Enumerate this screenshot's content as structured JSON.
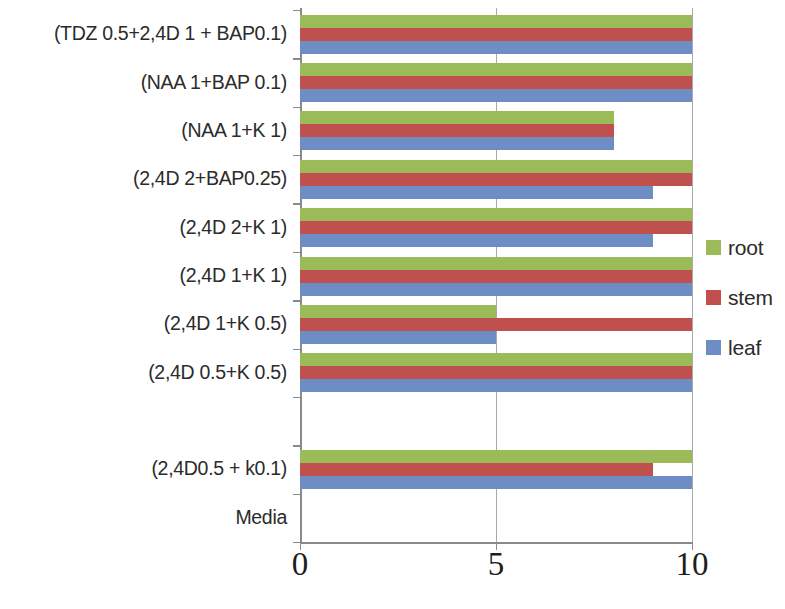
{
  "chart_data": {
    "type": "bar",
    "orientation": "horizontal",
    "title": "",
    "xlabel": "",
    "ylabel": "",
    "xlim": [
      0,
      10
    ],
    "xticks": [
      "0",
      "5",
      "10"
    ],
    "xtick_values": [
      0,
      5,
      10
    ],
    "grid": "vertical",
    "legend_position": "right",
    "categories": [
      "(TDZ 0.5+2,4D 1  + BAP0.1)",
      "(NAA 1+BAP 0.1)",
      "(NAA 1+K 1)",
      "(2,4D 2+BAP0.25)",
      "(2,4D 2+K 1)",
      "(2,4D 1+K 1)",
      "(2,4D 1+K 0.5)",
      "(2,4D 0.5+K 0.5)",
      "",
      "(2,4D0.5 + k0.1)",
      "Media"
    ],
    "series": [
      {
        "name": "root",
        "color": "#9bbb59",
        "values": [
          10,
          10,
          8,
          10,
          10,
          10,
          5,
          10,
          0,
          10,
          0
        ]
      },
      {
        "name": "stem",
        "color": "#c0504d",
        "values": [
          10,
          10,
          8,
          10,
          10,
          10,
          10,
          10,
          0,
          9,
          0
        ]
      },
      {
        "name": "leaf",
        "color": "#6d8dc4",
        "values": [
          10,
          10,
          8,
          9,
          9,
          10,
          5,
          10,
          0,
          10,
          0
        ]
      }
    ]
  },
  "legend": {
    "items": [
      {
        "label": "root",
        "color": "#9bbb59"
      },
      {
        "label": "stem",
        "color": "#c0504d"
      },
      {
        "label": "leaf",
        "color": "#6d8dc4"
      }
    ]
  }
}
